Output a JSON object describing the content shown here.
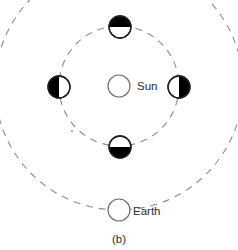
{
  "figure": {
    "caption": "(b)",
    "caption_position": "bottom-center"
  },
  "labels": {
    "sun": "Sun",
    "earth": "Earth"
  },
  "colors": {
    "background": "#ffffff",
    "orbit_stroke": "#8a8a8a",
    "body_outline": "#6f6f6f",
    "moon_outline": "#222222",
    "shadow_fill": "#000000",
    "text": "#2b2b2b"
  },
  "diagram_data": {
    "type": "diagram",
    "subject": "moon-phases-orbit",
    "center": {
      "x": 119,
      "y": 86
    },
    "orbits": [
      {
        "name": "inner-orbit",
        "radius": 60,
        "style": "dashed",
        "clipped": false
      },
      {
        "name": "outer-orbit",
        "radius": 124,
        "style": "dashed",
        "clipped": true
      }
    ],
    "bodies": [
      {
        "name": "sun",
        "label": "Sun",
        "x": 119,
        "y": 86,
        "radius": 11,
        "fill": "white",
        "shadow": "none"
      },
      {
        "name": "moon-top",
        "label": "",
        "x": 120,
        "y": 27,
        "radius": 11,
        "fill": "half",
        "shadow": "top"
      },
      {
        "name": "moon-left",
        "label": "",
        "x": 59,
        "y": 87,
        "radius": 11,
        "fill": "half",
        "shadow": "left"
      },
      {
        "name": "moon-right",
        "label": "",
        "x": 179,
        "y": 87,
        "radius": 11,
        "fill": "half",
        "shadow": "right"
      },
      {
        "name": "moon-bottom",
        "label": "",
        "x": 120,
        "y": 147,
        "radius": 11,
        "fill": "half",
        "shadow": "bottom"
      },
      {
        "name": "earth",
        "label": "Earth",
        "x": 119,
        "y": 210,
        "radius": 11,
        "fill": "white",
        "shadow": "none"
      }
    ]
  }
}
